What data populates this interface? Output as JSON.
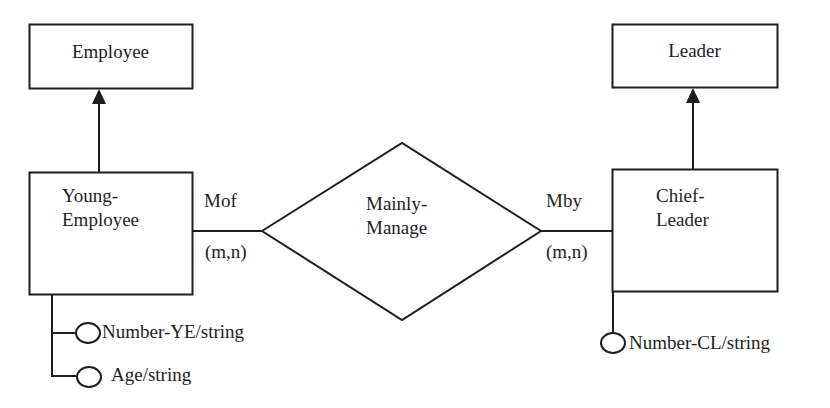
{
  "diagram": {
    "type": "entity-relationship",
    "entities": [
      {
        "id": "employee",
        "label": "Employee"
      },
      {
        "id": "young_employee",
        "label_line1": "Young-",
        "label_line2": "Employee",
        "attributes": [
          "Number-YE/string",
          "Age/string"
        ]
      },
      {
        "id": "leader",
        "label": "Leader"
      },
      {
        "id": "chief_leader",
        "label_line1": "Chief-",
        "label_line2": "Leader",
        "attributes": [
          "Number-CL/string"
        ]
      }
    ],
    "relationship": {
      "label_line1": "Mainly-",
      "label_line2": "Manage"
    },
    "roles": {
      "left": {
        "name": "Mof",
        "cardinality": "(m,n)"
      },
      "right": {
        "name": "Mby",
        "cardinality": "(m,n)"
      }
    },
    "generalizations": [
      {
        "from": "Young-Employee",
        "to": "Employee"
      },
      {
        "from": "Chief-Leader",
        "to": "Leader"
      }
    ],
    "colors": {
      "stroke": "#1e1e1e",
      "background": "#ffffff"
    }
  }
}
